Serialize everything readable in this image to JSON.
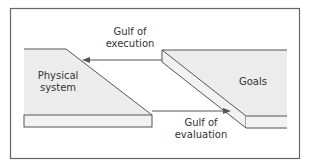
{
  "diagram": {
    "title": "",
    "left_block": {
      "label_line1": "Physical",
      "label_line2": "system"
    },
    "right_block": {
      "label": "Goals"
    },
    "top_arrow": {
      "label_line1": "Gulf of",
      "label_line2": "execution",
      "direction": "right-to-left"
    },
    "bottom_arrow": {
      "label_line1": "Gulf of",
      "label_line2": "evaluation",
      "direction": "left-to-right"
    },
    "colors": {
      "fill": "#e9e9e9",
      "stroke": "#555555",
      "frame": "#666666"
    }
  }
}
